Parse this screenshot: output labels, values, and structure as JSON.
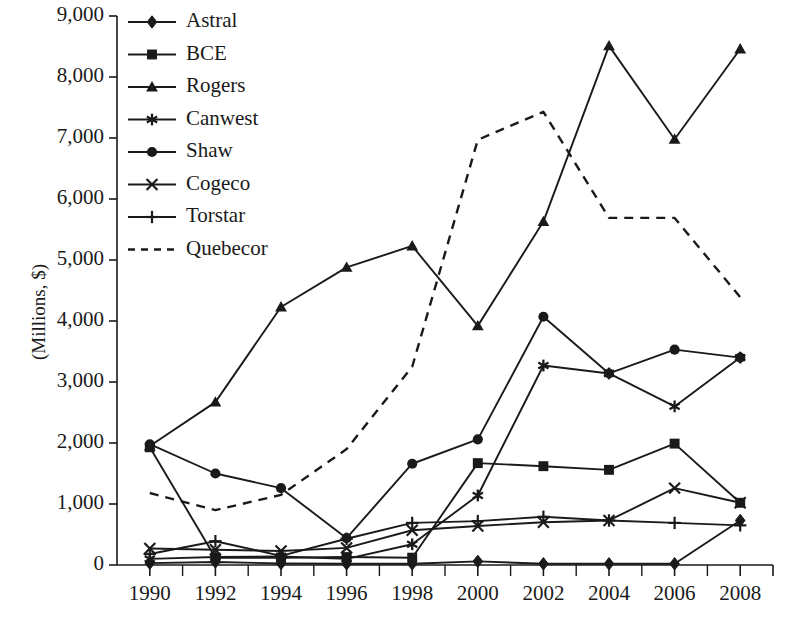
{
  "chart_data": {
    "type": "line",
    "title": "",
    "subtitle": "",
    "xlabel": "",
    "ylabel": "(Millions, $)",
    "x": [
      1990,
      1992,
      1994,
      1996,
      1998,
      2000,
      2002,
      2004,
      2006,
      2008
    ],
    "xticklabels": [
      "1990",
      "1992",
      "1994",
      "1996",
      "1998",
      "2000",
      "2002",
      "2004",
      "2006",
      "2008"
    ],
    "xlim": [
      1989,
      2009
    ],
    "ylim": [
      0,
      9000
    ],
    "yticks": [
      0,
      1000,
      2000,
      3000,
      4000,
      5000,
      6000,
      7000,
      8000,
      9000
    ],
    "yticklabels": [
      "0",
      "1,000",
      "2,000",
      "3,000",
      "4,000",
      "5,000",
      "6,000",
      "7,000",
      "8,000",
      "9,000"
    ],
    "grid": false,
    "minor_xticks": true,
    "legend_position": "top-left-inside",
    "series": [
      {
        "name": "Astral",
        "marker": "diamond",
        "linestyle": "solid",
        "values": [
          30,
          50,
          25,
          20,
          20,
          60,
          20,
          20,
          20,
          730
        ]
      },
      {
        "name": "BCE",
        "marker": "square",
        "linestyle": "solid",
        "values": [
          1930,
          120,
          120,
          130,
          120,
          1670,
          1620,
          1560,
          1990,
          1020
        ]
      },
      {
        "name": "Rogers",
        "marker": "triangle",
        "linestyle": "solid",
        "values": [
          1950,
          2670,
          4230,
          4880,
          5230,
          3920,
          5630,
          8510,
          6980,
          8460
        ]
      },
      {
        "name": "Canwest",
        "marker": "star",
        "linestyle": "solid",
        "values": [
          100,
          130,
          140,
          100,
          340,
          1140,
          3270,
          3140,
          2600,
          3400
        ]
      },
      {
        "name": "Shaw",
        "marker": "circle",
        "linestyle": "solid",
        "values": [
          1980,
          1500,
          1260,
          440,
          1660,
          2060,
          4070,
          3140,
          3530,
          3400
        ]
      },
      {
        "name": "Cogeco",
        "marker": "x",
        "linestyle": "solid",
        "values": [
          270,
          250,
          230,
          280,
          570,
          640,
          700,
          730,
          1260,
          1020
        ]
      },
      {
        "name": "Torstar",
        "marker": "plus",
        "linestyle": "solid",
        "values": [
          180,
          390,
          150,
          430,
          690,
          720,
          790,
          730,
          690,
          650
        ]
      },
      {
        "name": "Quebecor",
        "marker": "none",
        "linestyle": "dashed",
        "values": [
          1180,
          900,
          1150,
          1900,
          3250,
          6970,
          7430,
          5690,
          5690,
          4390
        ]
      }
    ]
  },
  "legend": {
    "items": [
      {
        "label": "Astral"
      },
      {
        "label": "BCE"
      },
      {
        "label": "Rogers"
      },
      {
        "label": "Canwest"
      },
      {
        "label": "Shaw"
      },
      {
        "label": "Cogeco"
      },
      {
        "label": "Torstar"
      },
      {
        "label": "Quebecor"
      }
    ]
  },
  "colors": {
    "line": "#1a1a1a",
    "axis": "#1a1a1a",
    "text": "#1a1a1a",
    "background": "#ffffff"
  }
}
